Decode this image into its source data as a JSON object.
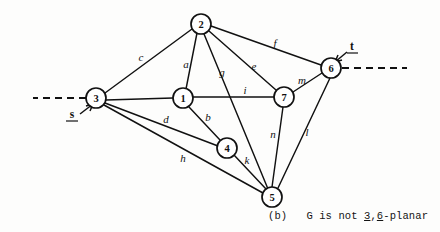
{
  "figure": {
    "caption_prefix": "(b)",
    "caption_text": "G is not",
    "caption_param_1": "3",
    "caption_comma": ",",
    "caption_param_2": "6",
    "caption_suffix": "-planar",
    "caption_full": "(b)   G is not 3,6-planar",
    "ink_color": "#111111",
    "background_color": "#fdfdfc"
  },
  "graph": {
    "type": "undirected-graph",
    "node_radius": 10,
    "nodes": [
      {
        "id": "1",
        "label": "1",
        "x": 183,
        "y": 98
      },
      {
        "id": "2",
        "label": "2",
        "x": 201,
        "y": 24
      },
      {
        "id": "3",
        "label": "3",
        "x": 96,
        "y": 98
      },
      {
        "id": "4",
        "label": "4",
        "x": 227,
        "y": 148
      },
      {
        "id": "5",
        "label": "5",
        "x": 272,
        "y": 197
      },
      {
        "id": "6",
        "label": "6",
        "x": 331,
        "y": 68
      },
      {
        "id": "7",
        "label": "7",
        "x": 284,
        "y": 97
      }
    ],
    "edges": [
      {
        "label": "a",
        "from": "2",
        "to": "1",
        "lx": 186,
        "ly": 64
      },
      {
        "label": "b",
        "from": "1",
        "to": "4",
        "lx": 208,
        "ly": 117
      },
      {
        "label": "c",
        "from": "2",
        "to": "3",
        "lx": 141,
        "ly": 57
      },
      {
        "label": "d",
        "from": "3",
        "to": "4",
        "lx": 166,
        "ly": 119
      },
      {
        "label": "e",
        "from": "2",
        "to": "7",
        "lx": 254,
        "ly": 66
      },
      {
        "label": "f",
        "from": "2",
        "to": "6",
        "lx": 275,
        "ly": 43
      },
      {
        "label": "g",
        "from": "2",
        "to": "5",
        "lx": 222,
        "ly": 72
      },
      {
        "label": "h",
        "from": "3",
        "to": "5",
        "lx": 183,
        "ly": 158
      },
      {
        "label": "i",
        "from": "1",
        "to": "7",
        "lx": 245,
        "ly": 90
      },
      {
        "label": "k",
        "from": "4",
        "to": "5",
        "lx": 247,
        "ly": 160
      },
      {
        "label": "l",
        "from": "6",
        "to": "5",
        "lx": 307,
        "ly": 132
      },
      {
        "label": "m",
        "from": "7",
        "to": "6",
        "lx": 302,
        "ly": 80
      },
      {
        "label": "n",
        "from": "7",
        "to": "5",
        "lx": 273,
        "ly": 134
      },
      {
        "label": "",
        "from": "3",
        "to": "1",
        "lx": 0,
        "ly": 0
      }
    ],
    "terminals": [
      {
        "label": "s",
        "at_node": "3",
        "lx": 72,
        "ly": 115,
        "ray_side": "left"
      },
      {
        "label": "t",
        "at_node": "6",
        "lx": 352,
        "ly": 46,
        "ray_side": "right"
      }
    ]
  }
}
